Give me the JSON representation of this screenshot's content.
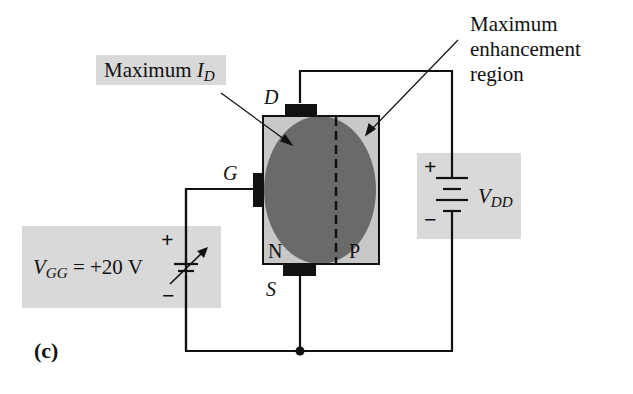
{
  "figure": {
    "panel_label": "(c)",
    "colors": {
      "background": "#ffffff",
      "label_box": "#d9d9d9",
      "channel_body": "#c8c8c8",
      "enhancement_region": "#6a6a6a",
      "wire": "#111111"
    }
  },
  "callouts": {
    "max_id": {
      "text": "Maximum",
      "var": "I",
      "sub": "D"
    },
    "max_enhancement": {
      "line1": "Maximum",
      "line2": "enhancement",
      "line3": "region"
    }
  },
  "terminals": {
    "drain": "D",
    "gate": "G",
    "source": "S"
  },
  "regions": {
    "n": "N",
    "p": "P"
  },
  "sources": {
    "vgg": {
      "var": "V",
      "sub": "GG",
      "value": "= +20 V",
      "plus": "+",
      "minus": "−"
    },
    "vdd": {
      "var": "V",
      "sub": "DD",
      "plus": "+",
      "minus": "−"
    }
  }
}
